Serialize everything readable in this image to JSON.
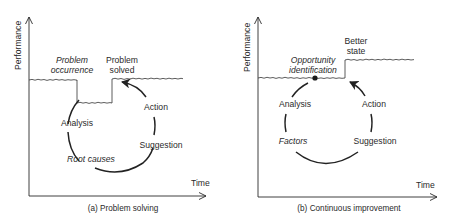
{
  "panels": [
    {
      "id": "a",
      "caption": "(a) Problem solving",
      "y_axis_label": "Performance",
      "x_axis_label": "Time",
      "performance_labels": {
        "drop_line1": "Problem",
        "drop_line2": "occurrence",
        "recover_line1": "Problem",
        "recover_line2": "solved"
      },
      "cycle": {
        "top_left": "Analysis",
        "top_right": "Action",
        "bottom_left": "Root causes",
        "bottom_right": "Suggestion"
      }
    },
    {
      "id": "b",
      "caption": "(b) Continuous improvement",
      "y_axis_label": "Performance",
      "x_axis_label": "Time",
      "performance_labels": {
        "trigger_line1": "Opportunity",
        "trigger_line2": "identification",
        "result_line1": "Better",
        "result_line2": "state"
      },
      "cycle": {
        "top_left": "Analysis",
        "top_right": "Action",
        "bottom_left": "Factors",
        "bottom_right": "Suggestion"
      }
    }
  ],
  "colors": {
    "ink": "#2a2a2a",
    "background": "#ffffff"
  }
}
